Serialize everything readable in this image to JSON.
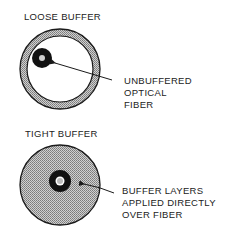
{
  "diagram": {
    "loose": {
      "title": "LOOSE BUFFER",
      "callout": [
        "UNBUFFERED",
        "OPTICAL",
        "FIBER"
      ]
    },
    "tight": {
      "title": "TIGHT BUFFER",
      "callout": [
        "BUFFER LAYERS",
        "APPLIED DIRECTLY",
        "OVER FIBER"
      ]
    },
    "colors": {
      "ink": "#1a1a1a",
      "hatch": "#9a9a9a",
      "core": "#c8c8c8",
      "background": "#ffffff"
    }
  }
}
